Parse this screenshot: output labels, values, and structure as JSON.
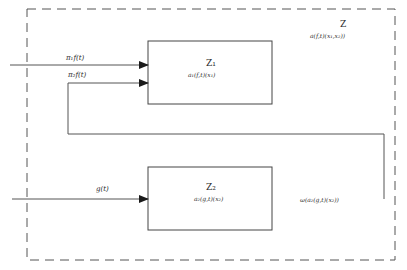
{
  "diagram": {
    "container": {
      "name": "Z",
      "formula": "a(f,t)(x1,x2)",
      "style": "dashed"
    },
    "blocks": [
      {
        "id": "z1",
        "name": "Z1",
        "formula": "a1(f,t)(x1)"
      },
      {
        "id": "z2",
        "name": "Z2",
        "formula": "a2(g,t)(x2)"
      }
    ],
    "edges": [
      {
        "id": "input-1",
        "label": "π1 f(t)",
        "target": "Z1"
      },
      {
        "id": "input-2",
        "label": "π2 f(t)",
        "target": "Z1",
        "source": "feedback from Z2 output"
      },
      {
        "id": "input-g",
        "label": "g(t)",
        "target": "Z2"
      },
      {
        "id": "output-z2",
        "label": "ω(a2(g,t)(x2))",
        "target": "feedback to Z1"
      }
    ]
  },
  "labels": {
    "container_name": "Z",
    "container_formula": "a(f,t)(x₁,x₂))",
    "z1_name": "Z₁",
    "z1_formula": "a₁(f,t)(x₁)",
    "z2_name": "Z₂",
    "z2_formula": "a₂(g,t)(x₂)",
    "edge_pi1": "π₁f(t)",
    "edge_pi2": "π₂f(t)",
    "edge_g": "g(t)",
    "edge_feedback": "ω(a₂(g,t)(x₂))"
  }
}
